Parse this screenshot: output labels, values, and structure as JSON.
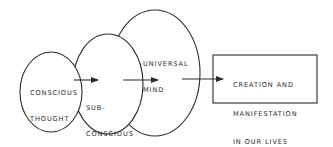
{
  "diagram": {
    "nodes": [
      {
        "id": "conscious",
        "shape": "ellipse",
        "lines": [
          "CONSCIOUS",
          "THOUGHT"
        ]
      },
      {
        "id": "subconscious",
        "shape": "ellipse",
        "lines": [
          "SUB-",
          "CONSCIOUS",
          "MIND"
        ]
      },
      {
        "id": "universal",
        "shape": "ellipse",
        "lines": [
          "UNIVERSAL",
          "MIND"
        ]
      },
      {
        "id": "creation",
        "shape": "rectangle",
        "lines": [
          "CREATION AND",
          "MANIFESTATION",
          "IN OUR LIVES"
        ]
      }
    ],
    "edges": [
      {
        "from": "conscious",
        "to": "subconscious"
      },
      {
        "from": "subconscious",
        "to": "universal"
      },
      {
        "from": "universal",
        "to": "creation"
      }
    ],
    "colors": {
      "stroke": "#2b2b2b",
      "background": "#ffffff"
    }
  }
}
